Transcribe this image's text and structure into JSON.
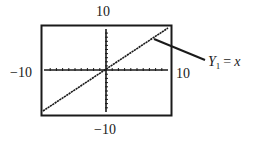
{
  "figure": {
    "window": {
      "xmin_label": "−10",
      "xmax_label": "10",
      "ymin_label": "−10",
      "ymax_label": "10"
    },
    "function_label": {
      "var": "Y",
      "subscript": "1",
      "equals": "=",
      "expr": "x"
    }
  },
  "chart_data": {
    "type": "line",
    "title": "",
    "xlabel": "",
    "ylabel": "",
    "xlim": [
      -10,
      10
    ],
    "ylim": [
      -10,
      10
    ],
    "grid": false,
    "tick_marks": {
      "x_step": 1,
      "y_step": 1
    },
    "series": [
      {
        "name": "Y1 = x",
        "x": [
          -10,
          10
        ],
        "y": [
          -10,
          10
        ]
      }
    ],
    "annotations": [
      {
        "text": "Y1 = x",
        "position": "right of window",
        "callout_to": "upper-right portion of line"
      }
    ],
    "tick_labels": {
      "x": [
        "−10",
        "10"
      ],
      "y": [
        "−10",
        "10"
      ]
    },
    "colors": {
      "line": "#1a1a1a",
      "frame": "#1a1a1a",
      "background": "#ffffff"
    }
  }
}
